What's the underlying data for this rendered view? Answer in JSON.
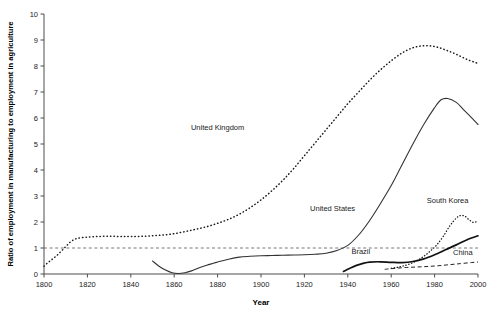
{
  "chart_data": {
    "type": "line",
    "title": "",
    "xlabel": "Year",
    "ylabel": "Ratio of employment in manufacturing to employment in agriculture",
    "xlim": [
      1800,
      2000
    ],
    "ylim": [
      0,
      10
    ],
    "xticks": [
      "1800",
      "1820",
      "1840",
      "1860",
      "1880",
      "1900",
      "1920",
      "1940",
      "1960",
      "1980",
      "2000"
    ],
    "yticks": [
      "0",
      "1",
      "2",
      "3",
      "4",
      "5",
      "6",
      "7",
      "8",
      "9",
      "10"
    ],
    "grid": false,
    "legend_position": "inline-annotations",
    "annotations": [
      {
        "text": "United Kingdom",
        "x": 1880,
        "y": 5.55
      },
      {
        "text": "United States",
        "x": 1933,
        "y": 2.42
      },
      {
        "text": "South Korea",
        "x": 1986,
        "y": 2.72
      },
      {
        "text": "Brazil",
        "x": 1946,
        "y": 0.78
      },
      {
        "text": "China",
        "x": 1993,
        "y": 0.72
      }
    ],
    "reference_lines": [
      {
        "axis": "y",
        "value": 1,
        "style": "dashed",
        "label": ""
      }
    ],
    "series": [
      {
        "name": "United Kingdom",
        "style": "dotted",
        "x": [
          1800,
          1802,
          1804,
          1806,
          1808,
          1810,
          1812,
          1814,
          1816,
          1820,
          1824,
          1828,
          1832,
          1836,
          1840,
          1845,
          1850,
          1855,
          1860,
          1865,
          1870,
          1875,
          1880,
          1885,
          1890,
          1895,
          1900,
          1905,
          1910,
          1915,
          1920,
          1925,
          1930,
          1935,
          1940,
          1945,
          1950,
          1955,
          1960,
          1965,
          1970,
          1975,
          1980,
          1985,
          1990,
          1995,
          2000
        ],
        "values": [
          0.3,
          0.45,
          0.58,
          0.72,
          0.88,
          1.05,
          1.22,
          1.33,
          1.38,
          1.42,
          1.44,
          1.45,
          1.45,
          1.44,
          1.44,
          1.45,
          1.47,
          1.5,
          1.55,
          1.63,
          1.72,
          1.82,
          1.95,
          2.1,
          2.3,
          2.55,
          2.85,
          3.2,
          3.6,
          4.05,
          4.55,
          5.05,
          5.55,
          6.05,
          6.55,
          7.0,
          7.45,
          7.85,
          8.2,
          8.5,
          8.7,
          8.78,
          8.75,
          8.62,
          8.45,
          8.25,
          8.1
        ]
      },
      {
        "name": "United States",
        "style": "solid",
        "x": [
          1850,
          1853,
          1856,
          1859,
          1862,
          1865,
          1868,
          1871,
          1875,
          1880,
          1885,
          1890,
          1895,
          1900,
          1905,
          1910,
          1915,
          1920,
          1925,
          1930,
          1935,
          1940,
          1945,
          1950,
          1955,
          1960,
          1965,
          1970,
          1975,
          1980,
          1983,
          1986,
          1990,
          1993,
          1996,
          2000
        ],
        "values": [
          0.5,
          0.3,
          0.15,
          0.05,
          0.02,
          0.05,
          0.12,
          0.22,
          0.34,
          0.46,
          0.57,
          0.65,
          0.68,
          0.7,
          0.71,
          0.72,
          0.73,
          0.74,
          0.76,
          0.8,
          0.9,
          1.1,
          1.5,
          2.05,
          2.7,
          3.4,
          4.2,
          5.0,
          5.75,
          6.4,
          6.7,
          6.75,
          6.6,
          6.35,
          6.1,
          5.75
        ]
      },
      {
        "name": "South Korea",
        "style": "dotted",
        "x": [
          1960,
          1963,
          1966,
          1969,
          1972,
          1975,
          1978,
          1981,
          1984,
          1987,
          1990,
          1992,
          1994,
          1996,
          1998,
          2000
        ],
        "values": [
          0.22,
          0.26,
          0.32,
          0.4,
          0.52,
          0.68,
          0.88,
          1.12,
          1.45,
          1.85,
          2.15,
          2.25,
          2.22,
          2.08,
          1.98,
          2.05
        ]
      },
      {
        "name": "Brazil",
        "style": "solid-thick",
        "x": [
          1938,
          1941,
          1944,
          1947,
          1950,
          1955,
          1960,
          1965,
          1970,
          1975,
          1980,
          1985,
          1990,
          1995,
          2000
        ],
        "values": [
          0.1,
          0.22,
          0.33,
          0.41,
          0.46,
          0.47,
          0.45,
          0.44,
          0.48,
          0.58,
          0.74,
          0.93,
          1.12,
          1.32,
          1.47
        ]
      },
      {
        "name": "China",
        "style": "dashed",
        "x": [
          1957,
          1962,
          1967,
          1972,
          1977,
          1982,
          1987,
          1992,
          1997,
          2000
        ],
        "values": [
          0.18,
          0.22,
          0.25,
          0.27,
          0.29,
          0.32,
          0.36,
          0.4,
          0.44,
          0.46
        ]
      }
    ]
  }
}
